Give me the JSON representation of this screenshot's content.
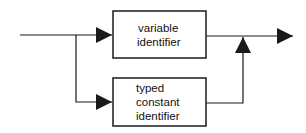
{
  "diagram": {
    "type": "syntax-diagram",
    "stroke_color": "#1a1a1a",
    "background": "#ffffff",
    "boxes": [
      {
        "id": "variable-identifier",
        "lines": [
          "variable",
          "identifier"
        ]
      },
      {
        "id": "typed-constant-identifier",
        "lines": [
          "typed",
          "constant",
          "identifier"
        ]
      }
    ],
    "flow": "input splits into two parallel paths (variable identifier | typed constant identifier) which merge into a single output"
  }
}
